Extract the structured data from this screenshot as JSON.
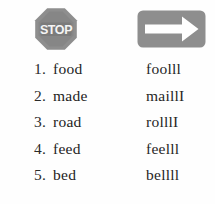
{
  "page": {
    "background_color": "#fefefe",
    "text_color": "#232323"
  },
  "header": {
    "icons": [
      {
        "name": "stop-sign-icon",
        "label": "STOP",
        "shape": "octagon",
        "fill_color": "#8e8e8e",
        "inner_fill_color": "#7b7b7b",
        "text_color": "#f4f4f4"
      },
      {
        "name": "right-arrow-icon",
        "label": "",
        "shape": "rounded-rectangle",
        "fill_color": "#8e8e8e",
        "arrow_color": "#ffffff"
      }
    ]
  },
  "word_list": {
    "columns": [
      "number",
      "word",
      "blend"
    ],
    "rows": [
      {
        "number": "1.",
        "word": "food",
        "blend": "foolll"
      },
      {
        "number": "2.",
        "word": "made",
        "blend": "maillI"
      },
      {
        "number": "3.",
        "word": "road",
        "blend": "rolllI"
      },
      {
        "number": "4.",
        "word": "feed",
        "blend": "feelll"
      },
      {
        "number": "5.",
        "word": "bed",
        "blend": "bellll"
      }
    ]
  }
}
